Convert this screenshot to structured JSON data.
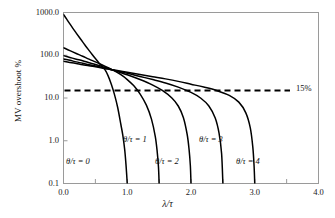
{
  "chart_data": {
    "type": "line",
    "title": "",
    "subtitle": "",
    "xlabel": "λ/τ",
    "ylabel": "MV overshoot %",
    "xlim": [
      0.0,
      4.0
    ],
    "ylim": [
      0.1,
      1000.0
    ],
    "yscale": "log",
    "xscale": "linear",
    "grid": false,
    "legend_position": "inline-annotations",
    "xticks": [
      "0.0",
      "1.0",
      "2.0",
      "3.0",
      "4.0"
    ],
    "xtick_values": [
      0.0,
      1.0,
      2.0,
      3.0,
      4.0
    ],
    "xminor_tick_values": [
      0.5,
      1.5,
      2.5,
      3.5
    ],
    "yticks": [
      "0.1",
      "1.0",
      "10.0",
      "100.0",
      "1000.0"
    ],
    "ytick_values": [
      0.1,
      1.0,
      10.0,
      100.0,
      1000.0
    ],
    "series": [
      {
        "name": "θ/τ = 0",
        "label": "θ/τ = 0",
        "color": "#000000",
        "style": "solid",
        "x": [
          0.0,
          0.05,
          0.1,
          0.15,
          0.2,
          0.25,
          0.3,
          0.35,
          0.4,
          0.45,
          0.5,
          0.55,
          0.6,
          0.65,
          0.7,
          0.75,
          0.8,
          0.85,
          0.9,
          0.93,
          0.96,
          0.98,
          0.99,
          1.0
        ],
        "y": [
          900,
          700,
          540,
          420,
          330,
          260,
          205,
          163,
          130,
          104,
          84,
          68,
          56,
          46,
          33,
          21,
          12,
          6.0,
          2.4,
          1.35,
          0.62,
          0.28,
          0.17,
          0.1
        ]
      },
      {
        "name": "θ/τ = 1",
        "label": "θ/τ = 1",
        "color": "#000000",
        "style": "solid",
        "x": [
          0.0,
          0.1,
          0.2,
          0.3,
          0.4,
          0.5,
          0.6,
          0.7,
          0.8,
          0.9,
          1.0,
          1.1,
          1.2,
          1.3,
          1.38,
          1.44,
          1.47,
          1.49,
          1.5
        ],
        "y": [
          150,
          128,
          110,
          95,
          81,
          70,
          60,
          51,
          43,
          35,
          27,
          19.5,
          12.5,
          6.8,
          3.2,
          1.25,
          0.55,
          0.24,
          0.1
        ]
      },
      {
        "name": "θ/τ = 2",
        "label": "θ/τ = 2",
        "color": "#000000",
        "style": "solid",
        "x": [
          0.0,
          0.1,
          0.2,
          0.3,
          0.4,
          0.5,
          0.6,
          0.7,
          0.8,
          0.9,
          1.0,
          1.2,
          1.4,
          1.55,
          1.7,
          1.8,
          1.88,
          1.94,
          1.97,
          1.99,
          2.0
        ],
        "y": [
          98,
          89,
          81,
          74,
          67,
          61,
          55,
          49,
          44,
          39,
          35,
          27,
          20,
          15,
          10,
          6.5,
          3.5,
          1.4,
          0.62,
          0.26,
          0.1
        ]
      },
      {
        "name": "θ/τ = 3",
        "label": "θ/τ = 3",
        "color": "#000000",
        "style": "solid",
        "x": [
          0.0,
          0.1,
          0.2,
          0.3,
          0.4,
          0.5,
          0.6,
          0.7,
          0.8,
          1.0,
          1.2,
          1.4,
          1.6,
          1.8,
          2.0,
          2.15,
          2.28,
          2.38,
          2.44,
          2.48,
          2.5
        ],
        "y": [
          82,
          76,
          70,
          65,
          60,
          56,
          52,
          48,
          44,
          38,
          32,
          27,
          22.5,
          18,
          13.5,
          10,
          6.5,
          3.4,
          1.5,
          0.5,
          0.1
        ]
      },
      {
        "name": "θ/τ = 4",
        "label": "θ/τ = 4",
        "color": "#000000",
        "style": "solid",
        "x": [
          0.0,
          0.1,
          0.2,
          0.3,
          0.4,
          0.5,
          0.6,
          0.7,
          0.8,
          1.0,
          1.2,
          1.4,
          1.6,
          1.8,
          2.0,
          2.2,
          2.4,
          2.6,
          2.75,
          2.86,
          2.93,
          2.97,
          2.99,
          3.0
        ],
        "y": [
          72,
          68,
          64,
          60,
          57,
          53.5,
          50.5,
          47.5,
          45,
          40,
          35.5,
          31.5,
          28,
          24.5,
          21,
          18,
          15,
          11.5,
          8.0,
          4.5,
          2.0,
          0.7,
          0.25,
          0.1
        ]
      }
    ],
    "annotations": [
      {
        "name": "threshold-line",
        "text": "15%",
        "type": "hline",
        "y_value": 15,
        "style": "dashed",
        "color": "#000000"
      }
    ]
  },
  "axes": {
    "y_label": "MV overshoot %",
    "x_label": "λ/τ",
    "y_tick_labels": [
      "1000.0",
      "100.0",
      "10.0",
      "1.0",
      "0.1"
    ],
    "x_tick_labels": [
      "0.0",
      "1.0",
      "2.0",
      "3.0",
      "4.0"
    ]
  },
  "curve_labels": [
    {
      "text": "θ/τ = 0",
      "x_px": 66,
      "y_px": 156
    },
    {
      "text": "θ/τ = 1",
      "x_px": 123,
      "y_px": 134
    },
    {
      "text": "θ/τ = 2",
      "x_px": 155,
      "y_px": 156
    },
    {
      "text": "θ/τ = 3",
      "x_px": 199,
      "y_px": 134
    },
    {
      "text": "θ/τ = 4",
      "x_px": 236,
      "y_px": 156
    }
  ],
  "threshold_label": "15%",
  "colors": {
    "curve": "#000000",
    "threshold": "#000000",
    "axis": "#9a9a9a",
    "text": "#1a1a1a",
    "background": "#ffffff"
  }
}
